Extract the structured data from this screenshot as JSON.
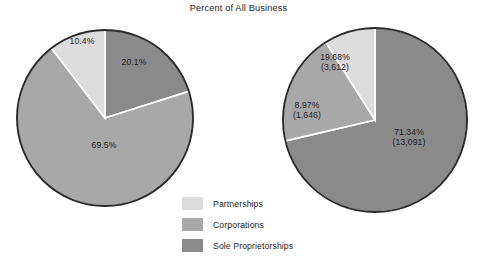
{
  "title": "Percent of All Business",
  "colors": {
    "partnerships": "#dcdcdc",
    "corporations": "#a8a8a8",
    "sole_proprietorships": "#8a8a8a",
    "background": "#ffffff",
    "outline": "#2b2b2b",
    "separator": "#ffffff",
    "text": "#1d1d1d"
  },
  "legend": {
    "items": [
      {
        "label": "Partnerships",
        "color": "#dcdcdc"
      },
      {
        "label": "Corporations",
        "color": "#a8a8a8"
      },
      {
        "label": "Sole Proprietorships",
        "color": "#8a8a8a"
      }
    ]
  },
  "left_pie": {
    "labels": {
      "sole_proprietorships": "20.1%",
      "partnerships": "10.4%",
      "corporations": "69.5%"
    }
  },
  "right_pie": {
    "labels": {
      "corporations_pct": "19.68%",
      "corporations_count": "(3,612)",
      "partnerships_pct": "8.97%",
      "partnerships_count": "(1,646)",
      "sole_proprietorships_pct": "71.34%",
      "sole_proprietorships_count": "(13,091)"
    }
  },
  "chart_data": [
    {
      "type": "pie",
      "title": "Percent of All Business",
      "subtitle": "Left pie",
      "categories": [
        "Sole Proprietorships",
        "Corporations",
        "Partnerships"
      ],
      "values": [
        20.1,
        69.5,
        10.4
      ],
      "value_labels": [
        "20.1%",
        "69.5%",
        "10.4%"
      ],
      "units": "percent",
      "start_angle_deg": 0,
      "direction": "clockwise",
      "colors": [
        "#8a8a8a",
        "#a8a8a8",
        "#dcdcdc"
      ],
      "legend_position": "bottom-center",
      "grid": false,
      "center": {
        "cx": 105,
        "cy": 118,
        "r": 88
      }
    },
    {
      "type": "pie",
      "title": "Percent of All Business",
      "subtitle": "Right pie",
      "categories": [
        "Sole Proprietorships",
        "Corporations",
        "Partnerships"
      ],
      "values": [
        71.34,
        19.68,
        8.97
      ],
      "counts": [
        13091,
        3612,
        1646
      ],
      "value_labels": [
        "71.34%",
        "19.68%",
        "8.97%"
      ],
      "count_labels": [
        "(13,091)",
        "(3,612)",
        "(1,646)"
      ],
      "units": "percent",
      "start_angle_deg": 0,
      "direction": "clockwise",
      "colors": [
        "#8a8a8a",
        "#a8a8a8",
        "#dcdcdc"
      ],
      "legend_position": "bottom-center",
      "grid": false,
      "center": {
        "cx": 375,
        "cy": 120,
        "r": 92
      }
    }
  ]
}
